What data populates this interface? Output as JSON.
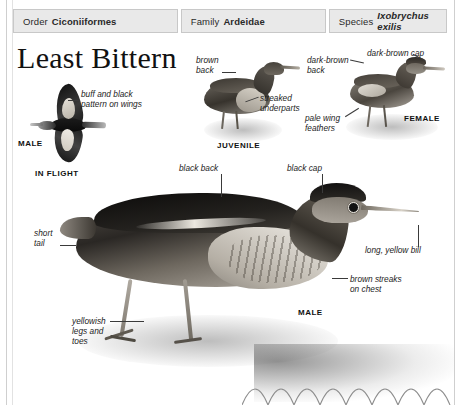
{
  "taxonomy": [
    {
      "key": "Order",
      "value": "Ciconiiformes",
      "italic": false
    },
    {
      "key": "Family",
      "value": "Ardeidae",
      "italic": false
    },
    {
      "key": "Species",
      "value": "Ixobrychus exilis",
      "italic": true
    }
  ],
  "title": "Least Bittern",
  "figures": {
    "in_flight": {
      "caption_sex": "MALE",
      "caption": "IN FLIGHT",
      "annotation": "buff and black\npattern on wings"
    },
    "juvenile": {
      "caption": "JUVENILE",
      "annotation_back": "brown\nback",
      "annotation_underparts": "streaked\nunderparts"
    },
    "female": {
      "caption": "FEMALE",
      "annotation_back": "dark-brown\nback",
      "annotation_cap": "dark-brown cap",
      "annotation_wing": "pale wing\nfeathers"
    },
    "male": {
      "caption": "MALE",
      "annotation_back": "black back",
      "annotation_cap": "black cap",
      "annotation_bill": "long, yellow bill",
      "annotation_chest": "brown streaks\non chest",
      "annotation_tail": "short\ntail",
      "annotation_legs": "yellowish\nlegs and\ntoes"
    }
  },
  "colors": {
    "header_bg": "#e9e9e9",
    "header_border": "#c8c8c8",
    "text": "#1a1a1a",
    "leader_line": "#3a3a3a",
    "page_rule": "#cfcfcf"
  }
}
